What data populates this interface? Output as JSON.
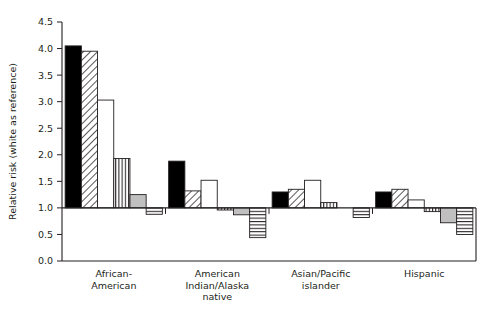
{
  "chart_data": {
    "type": "bar",
    "title": "",
    "subtitle": "",
    "xlabel": "",
    "ylabel": "Relative risk (white as reference)",
    "ylim": [
      0.0,
      4.5
    ],
    "yticks": [
      "0.0",
      "0.5",
      "1.0",
      "1.5",
      "2.0",
      "2.5",
      "3.0",
      "3.5",
      "4.0",
      "4.5"
    ],
    "ytick_values": [
      0.0,
      0.5,
      1.0,
      1.5,
      2.0,
      2.5,
      3.0,
      3.5,
      4.0,
      4.5
    ],
    "reference_line": 1.0,
    "grid": false,
    "legend_position": "none",
    "categories": [
      "African-American",
      "American Indian/Alaska native",
      "Asian/Pacific islander",
      "Hispanic"
    ],
    "category_label_lines": [
      [
        "African-",
        "American"
      ],
      [
        "American",
        "Indian/Alaska",
        "native"
      ],
      [
        "Asian/Pacific",
        "islander"
      ],
      [
        "Hispanic"
      ]
    ],
    "series": [
      {
        "name": "Series 1",
        "pattern": "solid-black",
        "fill": "#000000",
        "values": [
          4.05,
          1.88,
          1.3,
          1.3
        ]
      },
      {
        "name": "Series 2",
        "pattern": "diagonal-hatch",
        "fill": "#ffffff",
        "values": [
          3.95,
          1.32,
          1.35,
          1.35
        ]
      },
      {
        "name": "Series 3",
        "pattern": "open-white",
        "fill": "#ffffff",
        "values": [
          3.03,
          1.52,
          1.52,
          1.15
        ]
      },
      {
        "name": "Series 4",
        "pattern": "vertical-lines",
        "fill": "#ffffff",
        "values": [
          1.93,
          0.96,
          1.1,
          0.93
        ]
      },
      {
        "name": "Series 5",
        "pattern": "solid-gray",
        "fill": "#c0c0c0",
        "values": [
          1.25,
          0.87,
          1.0,
          0.72
        ]
      },
      {
        "name": "Series 6",
        "pattern": "horizontal-lines",
        "fill": "#ffffff",
        "values": [
          0.88,
          0.44,
          0.82,
          0.5
        ]
      }
    ]
  },
  "figure": {
    "background_color": "#ffffff",
    "axis_color": "#231f20"
  }
}
